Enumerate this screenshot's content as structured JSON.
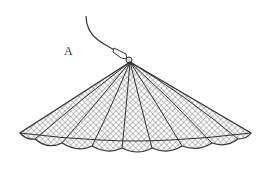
{
  "figure": {
    "label": "A",
    "colors": {
      "line": "#333333",
      "mesh": "#444444",
      "background": "#ffffff"
    }
  }
}
